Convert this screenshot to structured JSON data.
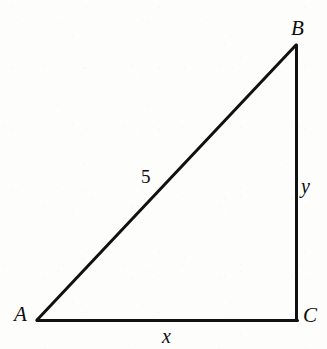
{
  "figure": {
    "kind": "right-triangle-diagram",
    "caption": "",
    "stroke_color": "#111111",
    "background_color": "#fdfdfc",
    "stroke_width": 3,
    "vertices": {
      "A": {
        "label": "A",
        "x": 37,
        "y": 320
      },
      "B": {
        "label": "B",
        "x": 296,
        "y": 45
      },
      "C": {
        "label": "C",
        "x": 296,
        "y": 320
      }
    },
    "sides": {
      "hypotenuse": {
        "label": "5",
        "from": "A",
        "to": "B"
      },
      "vertical_leg": {
        "label": "y",
        "from": "B",
        "to": "C"
      },
      "horizontal_leg": {
        "label": "x",
        "from": "A",
        "to": "C"
      }
    }
  },
  "chart_data": {
    "type": "diagram",
    "title": "",
    "shape": "right triangle",
    "points": [
      {
        "name": "A",
        "x": 37,
        "y": 320
      },
      {
        "name": "B",
        "x": 296,
        "y": 45
      },
      {
        "name": "C",
        "x": 296,
        "y": 320
      }
    ],
    "edges": [
      {
        "from": "A",
        "to": "B",
        "label": "5"
      },
      {
        "from": "B",
        "to": "C",
        "label": "y"
      },
      {
        "from": "A",
        "to": "C",
        "label": "x"
      }
    ],
    "right_angle_at": "C",
    "annotations": [
      "A",
      "B",
      "C",
      "5",
      "x",
      "y"
    ]
  }
}
